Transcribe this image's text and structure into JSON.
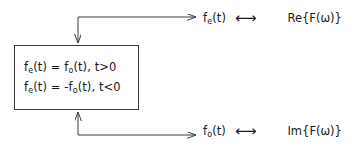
{
  "diagram": {
    "box": {
      "equations": [
        {
          "lhs": "f",
          "lhs_sub": "e",
          "lhs_arg": "(t)",
          "rel": "=",
          "rhs": "f",
          "rhs_sub": "o",
          "rhs_arg": "(t)",
          "condition": ", t>0",
          "sign": ""
        },
        {
          "lhs": "f",
          "lhs_sub": "e",
          "lhs_arg": "(t)",
          "rel": "=",
          "rhs": "f",
          "rhs_sub": "o",
          "rhs_arg": "(t)",
          "condition": ", t<0",
          "sign": "-"
        }
      ],
      "equation_text": [
        "f_e(t) = f_o(t), t>0",
        "f_e(t) = -f_o(t), t<0"
      ]
    },
    "pairs": [
      {
        "id": "even",
        "function": "f",
        "function_sub": "e",
        "function_arg": "(t)",
        "function_text": "f_e(t)",
        "relation_symbol": "⟷",
        "transform": "Re{F(ω)}"
      },
      {
        "id": "odd",
        "function": "f",
        "function_sub": "o",
        "function_arg": "(t)",
        "function_text": "f_o(t)",
        "relation_symbol": "⟷",
        "transform": "Im{F(ω)}"
      }
    ],
    "colors": {
      "stroke": "#3a3a3a",
      "text": "#1a1a1a",
      "background": "#ffffff"
    }
  }
}
